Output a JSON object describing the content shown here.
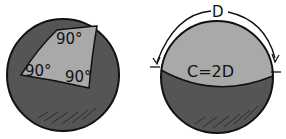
{
  "figure": {
    "left_sphere": {
      "angle_labels": [
        "90°",
        "90°",
        "90°"
      ],
      "colors": {
        "sphere": "#555555",
        "triangle": "#a9a9a9",
        "outline": "#111111"
      }
    },
    "right_sphere": {
      "arc_label": "D",
      "formula": "C=2D",
      "colors": {
        "cap": "#a9a9a9",
        "lower": "#555555",
        "outline": "#111111"
      }
    }
  }
}
